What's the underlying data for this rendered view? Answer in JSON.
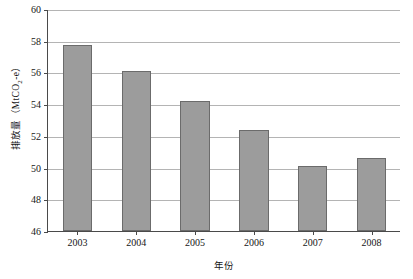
{
  "chart_data": {
    "type": "bar",
    "title": "",
    "xlabel": "年份",
    "ylabel": "排放量（MtCO2-e）",
    "ylabel_main": "排放量（MtCO",
    "ylabel_sub": "2",
    "ylabel_tail": "-e）",
    "categories": [
      "2003",
      "2004",
      "2005",
      "2006",
      "2007",
      "2008"
    ],
    "values": [
      57.7,
      56.1,
      54.2,
      52.35,
      50.1,
      50.6
    ],
    "ylim": [
      46,
      60
    ],
    "yticks": [
      46,
      48,
      50,
      52,
      54,
      56,
      58,
      60
    ],
    "ytick_labels": [
      "46",
      "48",
      "50",
      "52",
      "54",
      "56",
      "58",
      "60"
    ],
    "grid": true,
    "legend": null,
    "series_color": "#9c9c9c",
    "series_edge_color": "#6b6b6b",
    "grid_color": "#b4b4b4",
    "axis_color": "#4a4a4a"
  }
}
